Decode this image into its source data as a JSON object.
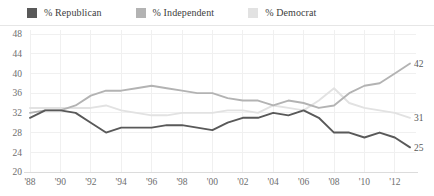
{
  "legend": {
    "items": [
      {
        "label": "% Republican",
        "color": "#595959",
        "icon": "square-swatch-icon"
      },
      {
        "label": "% Independent",
        "color": "#b3b3b3",
        "icon": "square-swatch-icon"
      },
      {
        "label": "% Democrat",
        "color": "#e2e2e2",
        "icon": "square-swatch-icon"
      }
    ]
  },
  "chart_data": {
    "type": "line",
    "title": "",
    "subtitle": "",
    "xlabel": "",
    "ylabel": "",
    "grid": true,
    "legend_position": "top-left",
    "xlim": [
      1988,
      2013
    ],
    "ylim": [
      20,
      48
    ],
    "yticks": [
      20,
      24,
      28,
      32,
      36,
      40,
      44,
      48
    ],
    "ytick_labels": [
      "20",
      "24",
      "28",
      "32",
      "36",
      "40",
      "44",
      "48"
    ],
    "xticks": [
      1988,
      1990,
      1992,
      1994,
      1996,
      1998,
      2000,
      2002,
      2004,
      2006,
      2008,
      2010,
      2012
    ],
    "xtick_labels": [
      "'88",
      "'90",
      "'92",
      "'94",
      "'96",
      "'98",
      "'00",
      "'02",
      "'04",
      "'06",
      "'08",
      "'10",
      "'12"
    ],
    "x": [
      1988,
      1989,
      1990,
      1991,
      1992,
      1993,
      1994,
      1995,
      1996,
      1997,
      1998,
      1999,
      2000,
      2001,
      2002,
      2003,
      2004,
      2005,
      2006,
      2007,
      2008,
      2009,
      2010,
      2011,
      2012,
      2013
    ],
    "series": [
      {
        "name": "% Republican",
        "color": "#595959",
        "end_label": "25",
        "values": [
          31,
          32.5,
          32.5,
          32,
          30,
          28,
          29,
          29,
          29,
          29.5,
          29.5,
          29,
          28.5,
          30,
          31,
          31,
          32,
          31.5,
          32.5,
          31,
          28,
          28,
          27,
          28,
          27,
          25
        ]
      },
      {
        "name": "% Independent",
        "color": "#b3b3b3",
        "end_label": "42",
        "values": [
          32,
          32.5,
          32.5,
          33.5,
          35.5,
          36.5,
          36.5,
          37,
          37.5,
          37,
          36.5,
          36,
          36,
          35,
          34.5,
          34.5,
          33.5,
          34.5,
          34,
          33,
          33.5,
          36,
          37.5,
          38,
          40,
          42
        ]
      },
      {
        "name": "% Democrat",
        "color": "#e2e2e2",
        "end_label": "31",
        "values": [
          33,
          33,
          33,
          33,
          33,
          33.5,
          32.5,
          32,
          31.5,
          31.5,
          32,
          32,
          32,
          32.5,
          32.5,
          32,
          33.5,
          33,
          32.5,
          34.5,
          37,
          34,
          33,
          32.5,
          32,
          31
        ]
      }
    ]
  }
}
